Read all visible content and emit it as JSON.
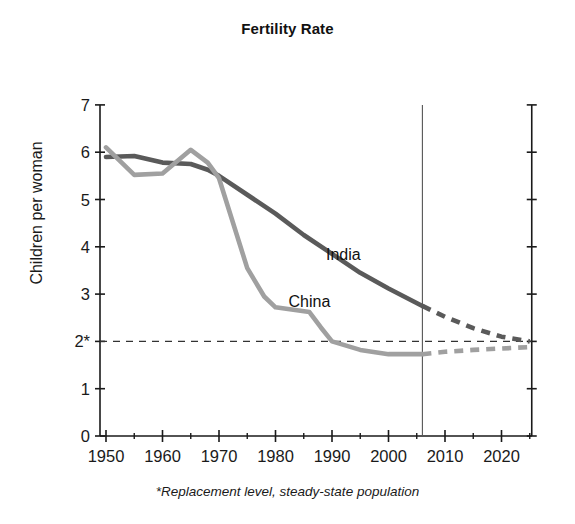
{
  "chart_data": {
    "type": "line",
    "title": "Fertility Rate",
    "xlabel": "",
    "ylabel": "Children per woman",
    "footnote": "*Replacement level, steady-state population",
    "xlim": [
      1948,
      2026
    ],
    "ylim": [
      0,
      7
    ],
    "grid": false,
    "legend_position": "inline-annotation",
    "y_ticks": [
      "0",
      "1",
      "2*",
      "3",
      "4",
      "5",
      "6",
      "7"
    ],
    "y_tick_values": [
      0,
      1,
      2,
      3,
      4,
      5,
      6,
      7
    ],
    "x_ticks": [
      "1950",
      "1960",
      "1970",
      "1980",
      "1990",
      "2000",
      "2010",
      "2020"
    ],
    "x_tick_values": [
      1950,
      1960,
      1970,
      1980,
      1990,
      2000,
      2010,
      2020
    ],
    "x_minor_tick_values": [
      1955,
      1965,
      1975,
      1985,
      1995,
      2005,
      2015,
      2025
    ],
    "annotations": [
      {
        "name": "replacement-level-line",
        "type": "hline",
        "y": 2.0,
        "style": "dashed",
        "label": "2*"
      },
      {
        "name": "projection-divider",
        "type": "vline",
        "x": 2006,
        "style": "solid"
      }
    ],
    "series": [
      {
        "name": "India",
        "color": "#5a5a5a",
        "label_x": 1992,
        "label_y": 3.72,
        "historical": [
          [
            1950,
            5.9
          ],
          [
            1955,
            5.92
          ],
          [
            1960,
            5.78
          ],
          [
            1965,
            5.75
          ],
          [
            1968,
            5.63
          ],
          [
            1970,
            5.5
          ],
          [
            1975,
            5.1
          ],
          [
            1980,
            4.7
          ],
          [
            1985,
            4.25
          ],
          [
            1990,
            3.85
          ],
          [
            1995,
            3.45
          ],
          [
            2000,
            3.12
          ],
          [
            2006,
            2.75
          ]
        ],
        "projection": [
          [
            2006,
            2.75
          ],
          [
            2010,
            2.52
          ],
          [
            2015,
            2.28
          ],
          [
            2020,
            2.1
          ],
          [
            2025,
            2.0
          ]
        ]
      },
      {
        "name": "China",
        "color": "#a0a0a0",
        "label_x": 1986,
        "label_y": 2.72,
        "historical": [
          [
            1950,
            6.1
          ],
          [
            1955,
            5.52
          ],
          [
            1960,
            5.55
          ],
          [
            1965,
            6.05
          ],
          [
            1968,
            5.78
          ],
          [
            1970,
            5.45
          ],
          [
            1975,
            3.55
          ],
          [
            1978,
            2.95
          ],
          [
            1980,
            2.72
          ],
          [
            1986,
            2.62
          ],
          [
            1988,
            2.3
          ],
          [
            1990,
            2.0
          ],
          [
            1995,
            1.82
          ],
          [
            2000,
            1.73
          ],
          [
            2006,
            1.73
          ]
        ],
        "projection": [
          [
            2006,
            1.73
          ],
          [
            2010,
            1.78
          ],
          [
            2015,
            1.82
          ],
          [
            2020,
            1.85
          ],
          [
            2025,
            1.88
          ]
        ]
      }
    ]
  },
  "chart": {
    "title": "Fertility Rate",
    "y_axis_label": "Children per woman",
    "footnote": "*Replacement level, steady-state population",
    "series_labels": {
      "india": "India",
      "china": "China"
    }
  },
  "colors": {
    "india": "#5a5a5a",
    "china": "#a0a0a0",
    "axis": "#1a1a1a",
    "background": "#ffffff"
  }
}
